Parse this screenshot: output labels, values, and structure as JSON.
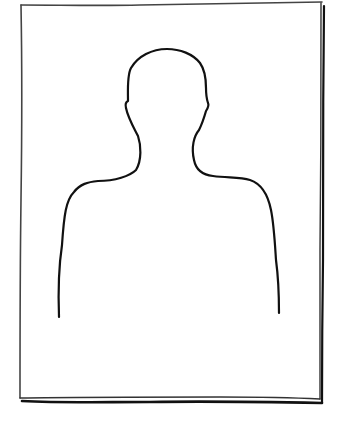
{
  "image": {
    "description": "Hand-drawn frame containing a blank person silhouette placeholder (head and shoulders)",
    "stroke_color": "#111111",
    "frame_color": "#333333",
    "background": "#ffffff"
  }
}
